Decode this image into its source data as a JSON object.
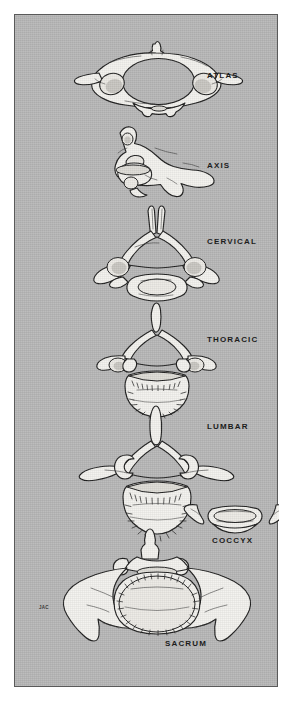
{
  "plate": {
    "title": "Types of Vertebrae - Superior Views",
    "background_color": "#ffffff",
    "panel_color": "#b7b7b7",
    "border_color": "#5a5a5a",
    "ink_color": "#1c1c1c",
    "bone_fill_color": "#f2f1ed",
    "shade_color": "#b9b7b2",
    "signature": "JAC"
  },
  "labels": [
    {
      "id": "atlas",
      "text": "ATLAS",
      "x": 192,
      "y": 62
    },
    {
      "id": "axis",
      "text": "AXIS",
      "x": 192,
      "y": 152
    },
    {
      "id": "cervical",
      "text": "CERVICAL",
      "x": 192,
      "y": 228
    },
    {
      "id": "thoracic",
      "text": "THORACIC",
      "x": 192,
      "y": 326
    },
    {
      "id": "lumbar",
      "text": "LUMBAR",
      "x": 192,
      "y": 413
    },
    {
      "id": "coccyx",
      "text": "COCCYX",
      "x": 199,
      "y": 527
    },
    {
      "id": "sacrum",
      "text": "SACRUM",
      "x": 152,
      "y": 630
    }
  ],
  "figures": [
    {
      "id": "atlas",
      "name": "Atlas (C1) vertebra, superior view",
      "label": "ATLAS",
      "center_x": 146,
      "center_y": 82
    },
    {
      "id": "axis",
      "name": "Axis (C2) vertebra, lateral view",
      "label": "AXIS",
      "center_x": 143,
      "center_y": 163
    },
    {
      "id": "cervical",
      "name": "Cervical vertebra, superior view",
      "label": "CERVICAL",
      "center_x": 141,
      "center_y": 252
    },
    {
      "id": "thoracic",
      "name": "Thoracic vertebra, superior view",
      "label": "THORACIC",
      "center_x": 141,
      "center_y": 350
    },
    {
      "id": "lumbar",
      "name": "Lumbar vertebra, superior view",
      "label": "LUMBAR",
      "center_x": 139,
      "center_y": 465
    },
    {
      "id": "coccyx",
      "name": "Coccyx, superior view",
      "label": "COCCYX",
      "center_x": 221,
      "center_y": 508
    },
    {
      "id": "sacrum",
      "name": "Sacrum, superior view",
      "label": "SACRUM",
      "center_x": 136,
      "center_y": 580
    }
  ]
}
